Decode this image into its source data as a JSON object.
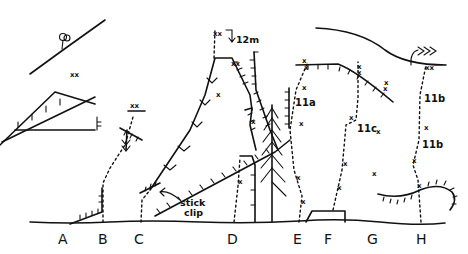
{
  "diagram": {
    "type": "climbing-topo",
    "routes": [
      {
        "id": "A",
        "label": "A",
        "x": 63
      },
      {
        "id": "B",
        "label": "B",
        "x": 103
      },
      {
        "id": "C",
        "label": "C",
        "x": 139
      },
      {
        "id": "D",
        "label": "D",
        "x": 232
      },
      {
        "id": "E",
        "label": "E",
        "x": 298
      },
      {
        "id": "F",
        "label": "F",
        "x": 329
      },
      {
        "id": "G",
        "label": "G",
        "x": 372
      },
      {
        "id": "H",
        "label": "H",
        "x": 421
      }
    ],
    "grades": [
      {
        "text": "11a",
        "x": 295,
        "y": 106
      },
      {
        "text": "11c",
        "x": 357,
        "y": 132
      },
      {
        "text": "11b",
        "x": 424,
        "y": 102
      },
      {
        "text": "11b",
        "x": 422,
        "y": 148
      }
    ],
    "annotations": {
      "rappel_height": "12m",
      "stick_clip_line1": "stick",
      "stick_clip_line2": "clip"
    },
    "bolt_marker": "x",
    "anchor_marker": "xx",
    "ink_color": "#111111",
    "background": "#ffffff"
  }
}
